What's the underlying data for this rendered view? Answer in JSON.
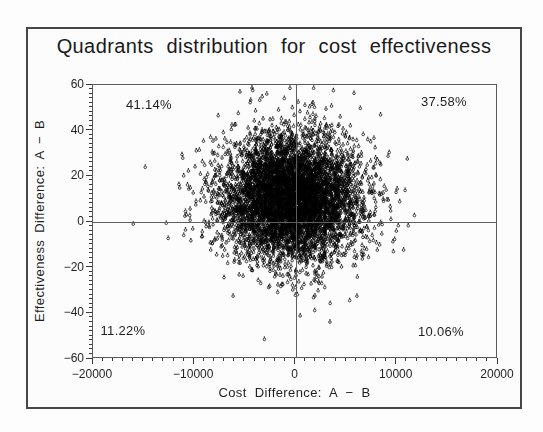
{
  "chart_data": {
    "type": "scatter",
    "title": "Quadrants distribution for cost effectiveness",
    "xlabel": "Cost Difference: A − B",
    "ylabel": "Effectiveness Difference: A − B",
    "xlim": [
      -20000,
      20000
    ],
    "ylim": [
      -60,
      60
    ],
    "x_ticks": [
      -20000,
      -10000,
      0,
      10000,
      20000
    ],
    "x_tick_labels": [
      "−20000",
      "−10000",
      "0",
      "10000",
      "20000"
    ],
    "y_ticks": [
      -60,
      -40,
      -20,
      0,
      20,
      40,
      60
    ],
    "y_tick_labels": [
      "−60",
      "−40",
      "−20",
      "0",
      "20",
      "40",
      "60"
    ],
    "x_minor_step": 1000,
    "y_minor_step": 2,
    "grid": false,
    "legend": "none",
    "reference_lines": {
      "x": 0,
      "y": 0
    },
    "quadrant_labels": [
      {
        "quadrant": "upper-left",
        "label": "41.14%"
      },
      {
        "quadrant": "upper-right",
        "label": "37.58%"
      },
      {
        "quadrant": "lower-left",
        "label": "11.22%"
      },
      {
        "quadrant": "lower-right",
        "label": "10.06%"
      }
    ],
    "marker": "circle-with-dot",
    "marker_color": "#000000",
    "cloud": {
      "n_points": 6000,
      "x_mean": -250,
      "x_std": 3400,
      "y_mean": 10.5,
      "y_std": 13.5,
      "seed": 7
    },
    "outliers": [
      [
        -4200,
        58.5
      ],
      [
        3500,
        -44
      ]
    ]
  }
}
